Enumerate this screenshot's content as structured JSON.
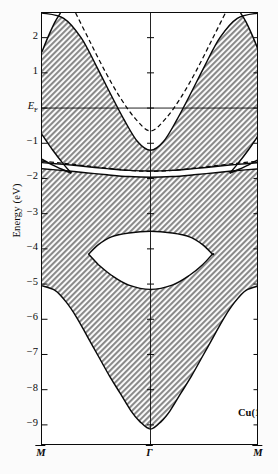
{
  "figure": {
    "material_label": "Cu(111)",
    "ylabel": "Energy (eV)"
  },
  "axis": {
    "y_ticks": [
      {
        "label": "2",
        "value": 2
      },
      {
        "label": "1",
        "value": 1
      },
      {
        "label": "EF",
        "value": 0
      },
      {
        "label": "−1",
        "value": -1
      },
      {
        "label": "−2",
        "value": -2
      },
      {
        "label": "−3",
        "value": -3
      },
      {
        "label": "−4",
        "value": -4
      },
      {
        "label": "−5",
        "value": -5
      },
      {
        "label": "−6",
        "value": -6
      },
      {
        "label": "−7",
        "value": -7
      },
      {
        "label": "−8",
        "value": -8
      },
      {
        "label": "−9",
        "value": -9
      }
    ],
    "fermi_label_main": "E",
    "fermi_label_sub": "F",
    "x_ticks": [
      {
        "label": "M",
        "overline": true,
        "pos": 0.0
      },
      {
        "label": "Γ",
        "overline": true,
        "pos": 0.5
      },
      {
        "label": "M",
        "overline": true,
        "pos": 1.0
      }
    ]
  },
  "chart_data": {
    "type": "line",
    "xlabel": "",
    "ylabel": "Energy (eV)",
    "xlim": [
      0,
      1
    ],
    "ylim": [
      -9.6,
      2.7
    ],
    "x_tick_labels": [
      "M̄",
      "Γ̄",
      "M̄"
    ],
    "y_tick_values": [
      2,
      1,
      0,
      -1,
      -2,
      -3,
      -4,
      -5,
      -6,
      -7,
      -8,
      -9
    ],
    "grid": false,
    "legend": null,
    "annotations": [
      {
        "text": "Cu(111)",
        "x": 0.74,
        "y": -8.15
      },
      {
        "text": "EF",
        "x": 0.0,
        "y": 0.0,
        "note": "Fermi level horizontal line at 0 eV"
      }
    ],
    "shading": "hatched grey = projected bulk band continuum; white = projected bulk band gaps",
    "series": [
      {
        "name": "upper_gap_left_edge",
        "style": "solid",
        "comment": "Left branch of the L-gap / sp band gap boundary, parabola-like from top of frame down to its minimum at Gamma",
        "points": [
          [
            0.0,
            2.7
          ],
          [
            0.1,
            2.55
          ],
          [
            0.18,
            2.0
          ],
          [
            0.25,
            1.2
          ],
          [
            0.32,
            0.35
          ],
          [
            0.38,
            -0.35
          ],
          [
            0.44,
            -0.95
          ],
          [
            0.5,
            -1.2
          ],
          [
            0.56,
            -0.95
          ],
          [
            0.62,
            -0.35
          ],
          [
            0.68,
            0.35
          ],
          [
            0.75,
            1.2
          ],
          [
            0.82,
            2.0
          ],
          [
            0.9,
            2.55
          ],
          [
            1.0,
            2.7
          ]
        ]
      },
      {
        "name": "upper_gap_right_edge_dashed",
        "style": "dashed",
        "comment": "Dashed parabola inside the sp gap (surface state / free-electron-like band), minimum about -0.65 eV at Gamma",
        "points": [
          [
            0.155,
            2.7
          ],
          [
            0.22,
            1.9
          ],
          [
            0.29,
            1.05
          ],
          [
            0.36,
            0.3
          ],
          [
            0.43,
            -0.3
          ],
          [
            0.5,
            -0.65
          ],
          [
            0.57,
            -0.3
          ],
          [
            0.64,
            0.3
          ],
          [
            0.71,
            1.05
          ],
          [
            0.78,
            1.9
          ],
          [
            0.845,
            2.7
          ]
        ]
      },
      {
        "name": "gap_band_upper_edge",
        "style": "solid",
        "comment": "Upper boundary of thin white band near -1.5 to -1.9 eV sweeping across the zone",
        "points": [
          [
            0.0,
            -1.55
          ],
          [
            0.1,
            -1.6
          ],
          [
            0.2,
            -1.66
          ],
          [
            0.3,
            -1.72
          ],
          [
            0.4,
            -1.77
          ],
          [
            0.5,
            -1.79
          ],
          [
            0.6,
            -1.77
          ],
          [
            0.7,
            -1.72
          ],
          [
            0.8,
            -1.66
          ],
          [
            0.9,
            -1.6
          ],
          [
            1.0,
            -1.55
          ]
        ]
      },
      {
        "name": "gap_band_dashed_center",
        "style": "dashed",
        "comment": "Dashed curve running through the thin white band",
        "points": [
          [
            0.0,
            -1.52
          ],
          [
            0.1,
            -1.58
          ],
          [
            0.2,
            -1.65
          ],
          [
            0.3,
            -1.72
          ],
          [
            0.4,
            -1.78
          ],
          [
            0.5,
            -1.81
          ],
          [
            0.6,
            -1.78
          ],
          [
            0.7,
            -1.72
          ],
          [
            0.8,
            -1.65
          ],
          [
            0.9,
            -1.58
          ],
          [
            1.0,
            -1.52
          ]
        ]
      },
      {
        "name": "left_wedge_upper_edge",
        "style": "solid",
        "comment": "Narrow triangular white wedge at M-bar: upper edge from -0.75 eV at M-bar converging to about -1.85 eV",
        "points": [
          [
            0.0,
            -0.75
          ],
          [
            0.05,
            -1.2
          ],
          [
            0.1,
            -1.6
          ],
          [
            0.135,
            -1.85
          ]
        ]
      },
      {
        "name": "left_wedge_lower_edge",
        "style": "solid",
        "points": [
          [
            0.0,
            -1.45
          ],
          [
            0.05,
            -1.62
          ],
          [
            0.1,
            -1.76
          ],
          [
            0.135,
            -1.85
          ]
        ]
      },
      {
        "name": "right_wedge_upper_edge",
        "style": "solid",
        "points": [
          [
            1.0,
            -0.75
          ],
          [
            0.95,
            -1.2
          ],
          [
            0.9,
            -1.6
          ],
          [
            0.865,
            -1.85
          ]
        ]
      },
      {
        "name": "right_wedge_lower_edge",
        "style": "solid",
        "points": [
          [
            1.0,
            -1.45
          ],
          [
            0.95,
            -1.62
          ],
          [
            0.9,
            -1.76
          ],
          [
            0.865,
            -1.85
          ]
        ]
      },
      {
        "name": "lens_gap_upper_edge",
        "style": "solid",
        "comment": "Upper edge of the lens-shaped (eye) gap in the d-band region",
        "points": [
          [
            0.215,
            -4.15
          ],
          [
            0.26,
            -3.88
          ],
          [
            0.32,
            -3.66
          ],
          [
            0.4,
            -3.55
          ],
          [
            0.5,
            -3.5
          ],
          [
            0.6,
            -3.55
          ],
          [
            0.68,
            -3.66
          ],
          [
            0.74,
            -3.88
          ],
          [
            0.785,
            -4.15
          ]
        ]
      },
      {
        "name": "lens_gap_lower_edge",
        "style": "solid",
        "points": [
          [
            0.215,
            -4.15
          ],
          [
            0.26,
            -4.45
          ],
          [
            0.32,
            -4.75
          ],
          [
            0.4,
            -5.03
          ],
          [
            0.5,
            -5.15
          ],
          [
            0.6,
            -5.03
          ],
          [
            0.68,
            -4.75
          ],
          [
            0.74,
            -4.45
          ],
          [
            0.785,
            -4.15
          ]
        ]
      },
      {
        "name": "bottom_band_edge",
        "style": "solid",
        "comment": "Bottom edge of the projected bulk continuum: -5.05 eV at M-bar dropping to -9.12 eV at Gamma",
        "points": [
          [
            0.0,
            -5.05
          ],
          [
            0.06,
            -5.18
          ],
          [
            0.11,
            -5.5
          ],
          [
            0.16,
            -5.95
          ],
          [
            0.21,
            -6.5
          ],
          [
            0.26,
            -7.05
          ],
          [
            0.31,
            -7.6
          ],
          [
            0.36,
            -8.1
          ],
          [
            0.41,
            -8.6
          ],
          [
            0.45,
            -8.9
          ],
          [
            0.5,
            -9.12
          ],
          [
            0.55,
            -8.9
          ],
          [
            0.59,
            -8.6
          ],
          [
            0.64,
            -8.1
          ],
          [
            0.69,
            -7.6
          ],
          [
            0.74,
            -7.05
          ],
          [
            0.79,
            -6.5
          ],
          [
            0.84,
            -5.95
          ],
          [
            0.89,
            -5.5
          ],
          [
            0.94,
            -5.18
          ],
          [
            1.0,
            -5.05
          ]
        ]
      },
      {
        "name": "top_band_edge_outer",
        "style": "solid",
        "comment": "Outer sp band edge rising from about 1.6 eV at M-bar to the top of the frame",
        "points": [
          [
            0.0,
            1.6
          ],
          [
            0.03,
            2.05
          ],
          [
            0.06,
            2.45
          ],
          [
            0.085,
            2.7
          ]
        ]
      },
      {
        "name": "top_band_edge_outer_right",
        "style": "solid",
        "points": [
          [
            1.0,
            1.6
          ],
          [
            0.97,
            2.05
          ],
          [
            0.94,
            2.45
          ],
          [
            0.915,
            2.7
          ]
        ]
      },
      {
        "name": "fermi_level",
        "style": "solid-thin",
        "comment": "Horizontal Fermi energy reference line at 0 eV",
        "points": [
          [
            0.0,
            0.0
          ],
          [
            1.0,
            0.0
          ]
        ]
      },
      {
        "name": "gamma_vertical",
        "style": "solid-thin",
        "comment": "Vertical line marking Gamma-bar at zone centre",
        "points": [
          [
            0.5,
            2.7
          ],
          [
            0.5,
            -9.6
          ]
        ]
      }
    ]
  },
  "colors": {
    "axis": "#0a0a0a",
    "hatch": "#7d7d7d",
    "gap_fill": "#ffffff",
    "background": "#fbfbfb"
  }
}
